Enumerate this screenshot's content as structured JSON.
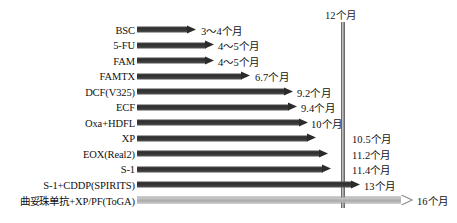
{
  "chart_data": {
    "type": "bar",
    "title": "",
    "xlabel": "",
    "ylabel": "",
    "orientation": "horizontal",
    "unit": "个月",
    "xlim": [
      0,
      16
    ],
    "grid": false,
    "legend": "none",
    "reference_line": {
      "value": 12,
      "label": "12个月",
      "name": "twelve-month-reference"
    },
    "axis_arrow_label": "16个月",
    "categories": [
      "BSC",
      "5-FU",
      "FAM",
      "FAMTX",
      "DCF(V325)",
      "ECF",
      "Oxa+HDFL",
      "XP",
      "EOX(Real2)",
      "S-1",
      "S-1+CDDP(SPIRITS)",
      "曲妥珠单抗+XP/PF(ToGA)"
    ],
    "values": [
      3.5,
      4.5,
      4.5,
      6.7,
      9.2,
      9.4,
      10,
      10.5,
      11.2,
      11.4,
      13,
      16
    ],
    "value_labels": [
      "3～4个月",
      "4～5个月",
      "4～5个月",
      "6.7个月",
      "9.2个月",
      "9.4个月",
      "10个月",
      "10.5个月",
      "11.2个月",
      "11.4个月",
      "13个月",
      "16个月"
    ],
    "series": [
      {
        "name": "median-overall-survival",
        "values": [
          3.5,
          4.5,
          4.5,
          6.7,
          9.2,
          9.4,
          10,
          10.5,
          11.2,
          11.4,
          13,
          16
        ]
      }
    ],
    "colors": {
      "bar_dark": "#2f2f2f",
      "bar_light": "#bcbcbc",
      "reference_line": "#8a8a8a",
      "text": "#111111",
      "background": "#ffffff"
    }
  },
  "rows": [
    {
      "label": "BSC",
      "value_label": "3～4个月",
      "bar_end_px": 196,
      "value_x_px": 201,
      "style": "dark"
    },
    {
      "label": "5-FU",
      "value_label": "4～5个月",
      "bar_end_px": 214,
      "value_x_px": 218,
      "style": "dark"
    },
    {
      "label": "FAM",
      "value_label": "4～5个月",
      "bar_end_px": 214,
      "value_x_px": 218,
      "style": "dark"
    },
    {
      "label": "FAMTX",
      "value_label": "6.7个月",
      "bar_end_px": 250,
      "value_x_px": 255,
      "style": "dark"
    },
    {
      "label": "DCF(V325)",
      "value_label": "9.2个月",
      "bar_end_px": 293,
      "value_x_px": 297,
      "style": "dark"
    },
    {
      "label": "ECF",
      "value_label": "9.4个月",
      "bar_end_px": 297,
      "value_x_px": 301,
      "style": "dark"
    },
    {
      "label": "Oxa+HDFL",
      "value_label": "10个月",
      "bar_end_px": 308,
      "value_x_px": 311,
      "style": "dark"
    },
    {
      "label": "XP",
      "value_label": "10.5个月",
      "bar_end_px": 316,
      "value_x_px": 352,
      "style": "dark"
    },
    {
      "label": "EOX(Real2)",
      "value_label": "11.2个月",
      "bar_end_px": 328,
      "value_x_px": 352,
      "style": "dark"
    },
    {
      "label": "S-1",
      "value_label": "11.4个月",
      "bar_end_px": 331,
      "value_x_px": 352,
      "style": "dark"
    },
    {
      "label": "S-1+CDDP(SPIRITS)",
      "value_label": "13个月",
      "bar_end_px": 360,
      "value_x_px": 364,
      "style": "dark"
    },
    {
      "label": "曲妥珠单抗+XP/PF(ToGA)",
      "value_label": "16个月",
      "bar_end_px": 412,
      "value_x_px": 417,
      "style": "light"
    }
  ],
  "layout": {
    "label_col_right_px": 135,
    "bar_start_px": 137,
    "row_top_px": 22,
    "row_pitch_px": 15.5,
    "ref_line_x_px": 341,
    "ref_label_x_px": 325,
    "ref_label_y_px": 7
  }
}
